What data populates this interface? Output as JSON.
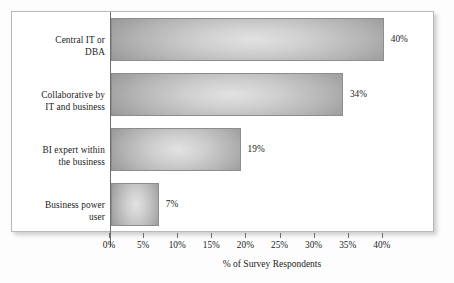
{
  "chart_data": {
    "type": "bar",
    "orientation": "horizontal",
    "title": "",
    "xlabel": "% of Survey Respondents",
    "ylabel": "",
    "categories": [
      "Central IT or DBA",
      "Collaborative by IT and business",
      "BI expert within the business",
      "Business power user"
    ],
    "category_lines": [
      [
        "Central IT or",
        "DBA"
      ],
      [
        "Collaborative by",
        "IT and business"
      ],
      [
        "BI expert within",
        "the business"
      ],
      [
        "Business power",
        "user"
      ]
    ],
    "values": [
      40,
      34,
      19,
      7
    ],
    "value_labels": [
      "40%",
      "34%",
      "19%",
      "7%"
    ],
    "xlim": [
      0,
      43
    ],
    "xticks": [
      0,
      5,
      10,
      15,
      20,
      25,
      30,
      35,
      40
    ],
    "xtick_labels": [
      "0%",
      "5%",
      "10%",
      "15%",
      "20%",
      "25%",
      "30%",
      "35%",
      "40%"
    ],
    "grid": false,
    "legend": null,
    "bar_color_edge": "#8e8e8e",
    "bar_color_center": "#e2e2e2",
    "frame_color": "#b9b9b9",
    "axis_color": "#6e6e6e",
    "text_color": "#1c1c1c"
  }
}
